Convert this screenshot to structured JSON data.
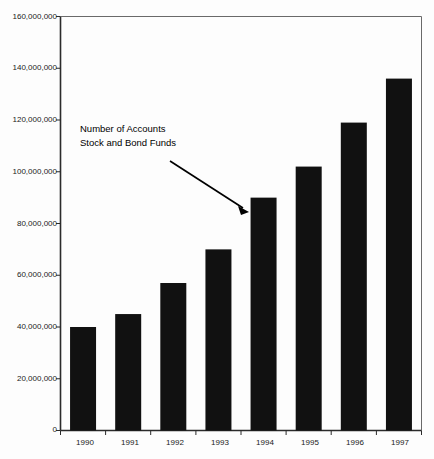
{
  "chart_data": {
    "type": "bar",
    "title": "",
    "subtitle": "",
    "xlabel": "",
    "ylabel": "",
    "categories": [
      "1990",
      "1991",
      "1992",
      "1993",
      "1994",
      "1995",
      "1996",
      "1997"
    ],
    "values": [
      40000000,
      45000000,
      57000000,
      70000000,
      90000000,
      102000000,
      119000000,
      136000000
    ],
    "series": [
      {
        "name": "Number of Accounts Stock and Bond Funds",
        "values": [
          40000000,
          45000000,
          57000000,
          70000000,
          90000000,
          102000000,
          119000000,
          136000000
        ]
      }
    ],
    "ylim": [
      0,
      160000000
    ],
    "ytick_values": [
      0,
      20000000,
      40000000,
      60000000,
      80000000,
      100000000,
      120000000,
      140000000,
      160000000
    ],
    "ytick_labels": [
      "0",
      "20,000,000",
      "40,000,000",
      "60,000,000",
      "80,000,000",
      "100,000,000",
      "120,000,000",
      "140,000,000",
      "160,000,000"
    ],
    "grid": false,
    "legend_position": "none",
    "bar_color": "#111111",
    "axis_color": "#2b2b2b",
    "annotations": [
      {
        "lines": [
          "Number of Accounts",
          "Stock and Bond Funds"
        ],
        "points_to_category": "1994",
        "arrow_from": [
          170,
          161
        ],
        "arrow_to": [
          248,
          212
        ]
      }
    ]
  },
  "annotation": {
    "line1": "Number of Accounts",
    "line2": "Stock and Bond Funds"
  },
  "axes": {
    "y_labels": [
      "160,000,000",
      "140,000,000",
      "120,000,000",
      "100,000,000",
      "80,000,000",
      "60,000,000",
      "40,000,000",
      "20,000,000",
      "0"
    ],
    "x_labels": [
      "1990",
      "1991",
      "1992",
      "1993",
      "1994",
      "1995",
      "1996",
      "1997"
    ]
  }
}
